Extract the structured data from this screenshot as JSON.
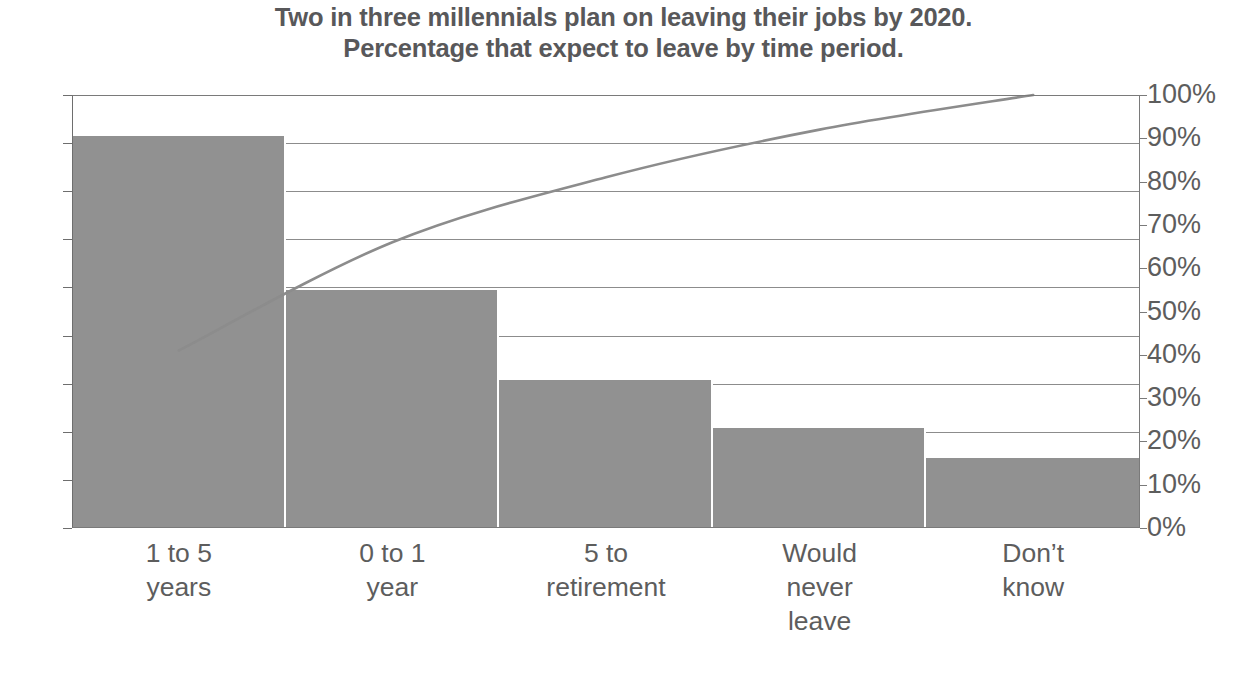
{
  "chart_data": {
    "type": "bar",
    "title": "Two in three millennials plan on leaving their jobs by 2020.\nPercentage that expect to leave by time period.",
    "title_line1": "Two in three millennials plan on leaving their jobs by 2020.",
    "title_line2": "Percentage that expect to leave by time period.",
    "xlabel": "",
    "ylabel": "",
    "ylabel_right": "",
    "categories": [
      "1 to 5\nyears",
      "0 to 1\nyear",
      "5 to\nretirement",
      "Would\nnever\nleave",
      "Don’t\nknow"
    ],
    "values": [
      40.7,
      24.7,
      15.4,
      10.4,
      7.3
    ],
    "ylim": [
      0,
      45
    ],
    "yticks": [
      "0",
      "5",
      "10",
      "15",
      "20",
      "25",
      "30",
      "35",
      "40",
      "45"
    ],
    "ytick_values": [
      0,
      5,
      10,
      15,
      20,
      25,
      30,
      35,
      40,
      45
    ],
    "ylim_right": [
      0,
      100
    ],
    "yticks_right": [
      "0%",
      "10%",
      "20%",
      "30%",
      "40%",
      "50%",
      "60%",
      "70%",
      "80%",
      "90%",
      "100%"
    ],
    "ytick_values_right": [
      0,
      10,
      20,
      30,
      40,
      50,
      60,
      70,
      80,
      90,
      100
    ],
    "series": [
      {
        "name": "Percentage that expect to leave",
        "type": "bar",
        "axis": "left",
        "values": [
          40.7,
          24.7,
          15.4,
          10.4,
          7.3
        ]
      },
      {
        "name": "Cumulative percentage",
        "type": "line",
        "axis": "right",
        "values": [
          41,
          66,
          81,
          92,
          100
        ]
      }
    ],
    "grid": true,
    "legend": "none",
    "colors": {
      "bar": "#919191",
      "line": "#8c8c8c",
      "gridline": "#8c8c8c",
      "axis": "#7a7a7a",
      "title_text": "#58585a",
      "tick_text": "#5d5d5d",
      "background": "#ffffff"
    }
  }
}
